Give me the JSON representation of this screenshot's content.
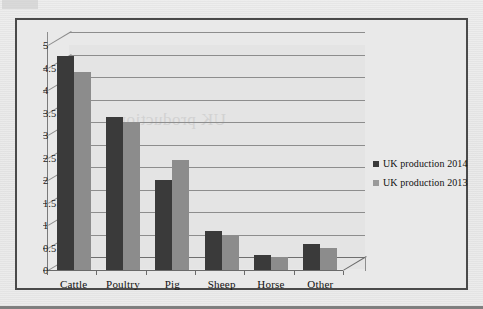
{
  "chart_data": {
    "type": "bar",
    "title": "",
    "xlabel": "",
    "ylabel": "",
    "categories": [
      "Cattle",
      "Poultry",
      "Pig",
      "Sheep",
      "Horse",
      "Other"
    ],
    "series": [
      {
        "name": "UK production 2014",
        "color": "#3a3a3a",
        "values": [
          4.75,
          3.4,
          2.0,
          0.87,
          0.33,
          0.58
        ]
      },
      {
        "name": "UK production 2013",
        "color": "#8c8c8c",
        "values": [
          4.4,
          3.3,
          2.45,
          0.75,
          0.28,
          0.5
        ]
      }
    ],
    "ylim": [
      0,
      5
    ],
    "ytick_step": 0.5,
    "ytick_labels": [
      "5",
      "4.5",
      "4",
      "3.5",
      "3",
      "2.5",
      "2",
      "1.5",
      "1",
      "0.5",
      "0"
    ],
    "grid": true,
    "legend_position": "right",
    "style_3d": true
  },
  "legend": {
    "entries": [
      {
        "label": "UK production 2014",
        "swatch": "legend-swatch-2014"
      },
      {
        "label": "UK production 2013",
        "swatch": "legend-swatch-2013"
      }
    ]
  },
  "watermark": {
    "text": "UK production"
  }
}
